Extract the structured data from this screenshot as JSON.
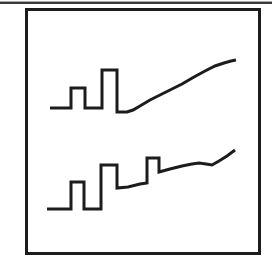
{
  "figure": {
    "type": "line-drawing",
    "background_color": "#ffffff",
    "frame_color": "#1c1c1c",
    "line_color": "#1c1c1c",
    "line_width": 3,
    "divider_colors": [
      "#a8a8a8",
      "#3c3c3c"
    ]
  },
  "chart_data": {
    "type": "line",
    "title": "",
    "xlabel": "",
    "ylabel": "",
    "legend": "none",
    "grid": false,
    "canvas": {
      "width": 272,
      "height": 264
    },
    "frame": {
      "left": 25,
      "top": 8,
      "width": 236,
      "height": 247
    },
    "series": [
      {
        "name": "upper-trace",
        "points": [
          [
            50,
            108
          ],
          [
            71,
            108
          ],
          [
            71,
            88
          ],
          [
            85,
            88
          ],
          [
            85,
            108
          ],
          [
            102,
            108
          ],
          [
            102,
            70
          ],
          [
            117,
            70
          ],
          [
            117,
            112
          ],
          [
            127,
            112
          ],
          [
            133,
            110
          ],
          [
            140,
            106
          ],
          [
            150,
            100
          ],
          [
            160,
            95
          ],
          [
            170,
            90
          ],
          [
            182,
            84
          ],
          [
            194,
            77
          ],
          [
            205,
            71
          ],
          [
            215,
            66
          ],
          [
            224,
            63
          ],
          [
            231,
            61
          ],
          [
            236,
            60
          ]
        ]
      },
      {
        "name": "lower-trace",
        "points": [
          [
            47,
            209
          ],
          [
            71,
            209
          ],
          [
            71,
            182
          ],
          [
            84,
            182
          ],
          [
            84,
            209
          ],
          [
            101,
            209
          ],
          [
            101,
            165
          ],
          [
            117,
            165
          ],
          [
            117,
            188
          ],
          [
            128,
            187
          ],
          [
            140,
            184
          ],
          [
            147,
            183
          ],
          [
            147,
            158
          ],
          [
            159,
            158
          ],
          [
            159,
            172
          ],
          [
            170,
            169
          ],
          [
            182,
            166
          ],
          [
            192,
            164
          ],
          [
            199,
            163
          ],
          [
            206,
            164
          ],
          [
            212,
            165
          ],
          [
            219,
            161
          ],
          [
            227,
            156
          ],
          [
            235,
            150
          ]
        ]
      }
    ]
  }
}
